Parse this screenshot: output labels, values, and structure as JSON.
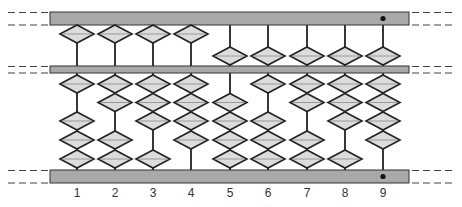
{
  "diagram": {
    "type": "abacus",
    "colors": {
      "frame_fill": "#a9a9a9",
      "frame_stroke": "#333333",
      "bead_fill": "#dcdcdc",
      "bead_stroke": "#222222",
      "rod": "#222222",
      "dash": "#444444",
      "unit_dot": "#111111"
    },
    "rods": [
      {
        "label": "1",
        "upper": "up",
        "lower_gap": 1
      },
      {
        "label": "2",
        "upper": "up",
        "lower_gap": 2
      },
      {
        "label": "3",
        "upper": "up",
        "lower_gap": 3
      },
      {
        "label": "4",
        "upper": "up",
        "lower_gap": 4
      },
      {
        "label": "5",
        "upper": "down",
        "lower_gap": 0
      },
      {
        "label": "6",
        "upper": "down",
        "lower_gap": 1
      },
      {
        "label": "7",
        "upper": "down",
        "lower_gap": 2
      },
      {
        "label": "8",
        "upper": "down",
        "lower_gap": 3
      },
      {
        "label": "9",
        "upper": "down",
        "lower_gap": 4
      }
    ],
    "unit_rod_marker": "9"
  }
}
